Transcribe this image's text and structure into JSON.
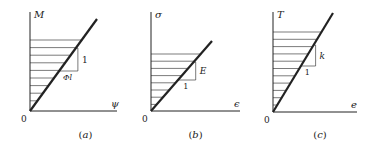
{
  "panels": [
    {
      "id": "a",
      "caption": "(a)",
      "y_label": "M",
      "x_label": "ψ",
      "origin_label": "0",
      "slope_rise_label": "1",
      "slope_run_label": "Φl",
      "axis": {
        "x0": 30,
        "y0": 111,
        "ytop": 12,
        "xend": 117
      },
      "line_end": [
        97,
        19
      ],
      "hatch": {
        "top": 40,
        "count": 9,
        "spacing": 7.6,
        "right": 80
      },
      "triangle": {
        "x1": 71,
        "y1": 48,
        "x2": 77,
        "y2": 71
      },
      "colors": {
        "stroke": "#222222"
      }
    },
    {
      "id": "b",
      "caption": "(b)",
      "y_label": "σ",
      "x_label": "ϵ",
      "origin_label": "0",
      "slope_rise_label": "E",
      "slope_run_label": "1",
      "axis": {
        "x0": 151,
        "y0": 111,
        "ytop": 12,
        "xend": 240
      },
      "line_end": [
        212,
        41
      ],
      "hatch": {
        "top": 54,
        "count": 8,
        "spacing": 7.2,
        "right": 196
      },
      "triangle": {
        "x1": 193,
        "y1": 62,
        "x2": 197,
        "y2": 80
      },
      "colors": {
        "stroke": "#222222"
      }
    },
    {
      "id": "c",
      "caption": "(c)",
      "y_label": "T",
      "x_label": "e",
      "origin_label": "0",
      "slope_rise_label": "k",
      "slope_run_label": "1",
      "axis": {
        "x0": 273,
        "y0": 112,
        "ytop": 12,
        "xend": 357
      },
      "line_end": [
        333,
        13
      ],
      "hatch": {
        "top": 32,
        "count": 11,
        "spacing": 7.3,
        "right": 319
      },
      "triangle": {
        "x1": 313,
        "y1": 45,
        "x2": 315,
        "y2": 66
      },
      "colors": {
        "stroke": "#222222"
      }
    }
  ]
}
